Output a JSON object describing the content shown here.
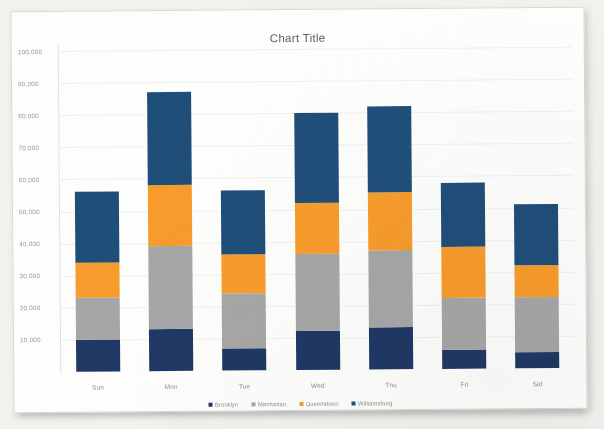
{
  "chart_data": {
    "type": "bar",
    "subtype": "stacked-column",
    "title": "Chart Title",
    "xlabel": "",
    "ylabel": "",
    "categories": [
      "Sun",
      "Mon",
      "Tue",
      "Wed",
      "Thu",
      "Fri",
      "Sat"
    ],
    "series": [
      {
        "name": "Brooklyn",
        "color": "#1f3864",
        "values": [
          10000,
          13000,
          7000,
          12000,
          13000,
          6000,
          5000
        ]
      },
      {
        "name": "Manhattan",
        "color": "#a6a6a6",
        "values": [
          13000,
          26000,
          17000,
          24000,
          24000,
          16000,
          17000
        ]
      },
      {
        "name": "Queensboro",
        "color": "#f79b2c",
        "values": [
          11000,
          19000,
          12000,
          16000,
          18000,
          16000,
          10000
        ]
      },
      {
        "name": "Williamsburg",
        "color": "#1f4e79",
        "values": [
          22000,
          29000,
          20000,
          28000,
          27000,
          20000,
          19000
        ]
      }
    ],
    "totals": [
      56000,
      87000,
      56000,
      80000,
      82000,
      58000,
      51000
    ],
    "ylim": [
      0,
      100000
    ],
    "yticks": [
      10000,
      20000,
      30000,
      40000,
      50000,
      60000,
      70000,
      80000,
      90000,
      100000
    ],
    "ytick_labels": [
      "10,000",
      "20,000",
      "30,000",
      "40,000",
      "50,000",
      "60,000",
      "70,000",
      "80,000",
      "90,000",
      "100,000"
    ],
    "grid": true,
    "grid_axis": "y",
    "legend_position": "bottom",
    "stack_order_bottom_to_top": [
      "Brooklyn",
      "Manhattan",
      "Queensboro",
      "Williamsburg"
    ]
  },
  "colors": {
    "brooklyn": "#1f3864",
    "manhattan": "#a6a6a6",
    "queensboro": "#f79b2c",
    "williamsburg": "#1f4e79",
    "gridline": "#efefef",
    "axis": "#e2e2e0",
    "tick_text": "#9a9a9a",
    "title_text": "#5f5f5f",
    "paper": "#fdfdfc",
    "backdrop": "#f2f1ee"
  }
}
